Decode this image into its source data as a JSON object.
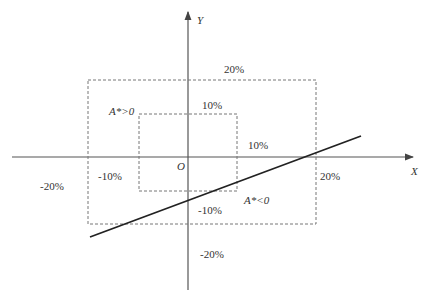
{
  "axes": {
    "x_label": "X",
    "y_label": "Y",
    "origin_label": "O"
  },
  "regions": {
    "outer_top": "20%",
    "inner_top": "10%",
    "inner_right": "10%",
    "outer_right": "20%",
    "outer_left": "-20%",
    "inner_left": "-10%",
    "inner_bottom": "-10%",
    "outer_bottom": "-20%"
  },
  "annotations": {
    "upper": "A*>0",
    "lower": "A*<0"
  },
  "colors": {
    "axis": "#555555",
    "line": "#222222",
    "dash": "#777777"
  }
}
